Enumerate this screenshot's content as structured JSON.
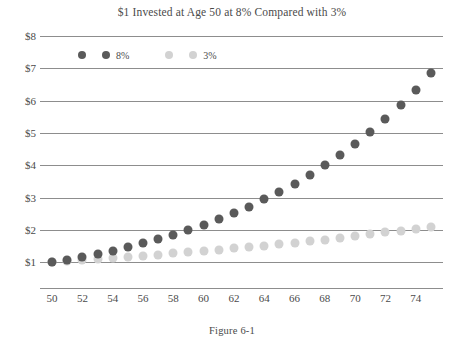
{
  "figure": {
    "caption": "Figure 6-1"
  },
  "chart_data": {
    "type": "scatter",
    "title": "$1 Invested at Age 50 at 8% Compared with 3%",
    "xlabel": "",
    "ylabel": "",
    "x": [
      50,
      51,
      52,
      53,
      54,
      55,
      56,
      57,
      58,
      59,
      60,
      61,
      62,
      63,
      64,
      65,
      66,
      67,
      68,
      69,
      70,
      71,
      72,
      73,
      74,
      75
    ],
    "xlim": [
      49.2,
      75.8
    ],
    "ylim": [
      0.2,
      8
    ],
    "x_tick_labels": [
      "50",
      "52",
      "54",
      "56",
      "58",
      "60",
      "62",
      "64",
      "66",
      "68",
      "70",
      "72",
      "74"
    ],
    "x_ticks": [
      50,
      52,
      54,
      56,
      58,
      60,
      62,
      64,
      66,
      68,
      70,
      72,
      74
    ],
    "y_ticks": [
      1,
      2,
      3,
      4,
      5,
      6,
      7,
      8
    ],
    "y_tick_labels": [
      "$1",
      "$2",
      "$3",
      "$4",
      "$5",
      "$6",
      "$7",
      "$8"
    ],
    "grid": true,
    "legend_position": "upper left",
    "series": [
      {
        "name": "8%",
        "color": "#5a5a5a",
        "values": [
          1.0,
          1.08,
          1.17,
          1.26,
          1.36,
          1.47,
          1.59,
          1.71,
          1.85,
          2.0,
          2.16,
          2.33,
          2.52,
          2.72,
          2.94,
          3.17,
          3.43,
          3.7,
          4.0,
          4.32,
          4.66,
          5.03,
          5.44,
          5.87,
          6.34,
          6.85
        ]
      },
      {
        "name": "3%",
        "color": "#d2d2d2",
        "values": [
          1.0,
          1.03,
          1.06,
          1.09,
          1.13,
          1.16,
          1.19,
          1.23,
          1.27,
          1.3,
          1.34,
          1.38,
          1.43,
          1.47,
          1.51,
          1.56,
          1.6,
          1.65,
          1.7,
          1.75,
          1.81,
          1.86,
          1.92,
          1.97,
          2.03,
          2.09
        ]
      }
    ]
  },
  "legend": {
    "entries": [
      {
        "label": "8%",
        "color": "#5a5a5a"
      },
      {
        "label": "3%",
        "color": "#d2d2d2"
      }
    ]
  }
}
